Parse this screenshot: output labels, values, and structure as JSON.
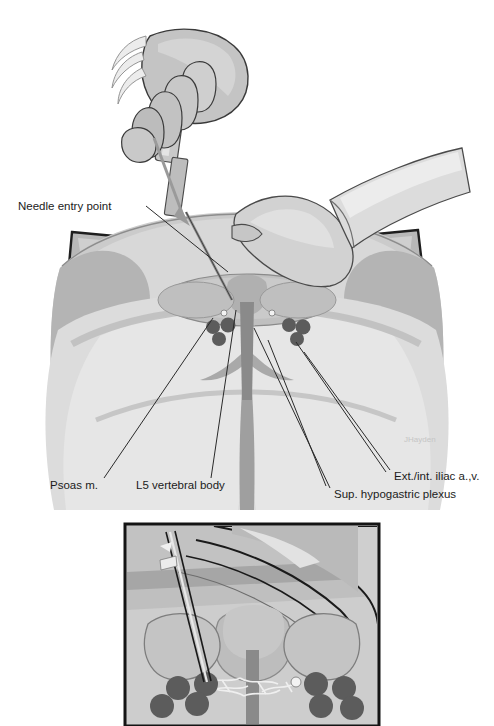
{
  "figure": {
    "type": "medical-illustration",
    "style": "grayscale-anatomical-drawing",
    "background": "#ffffff"
  },
  "labels": [
    {
      "id": "needle-entry-point",
      "text": "Needle entry point",
      "x": 18,
      "y": 210,
      "anchor": "start"
    },
    {
      "id": "psoas-muscle",
      "text": "Psoas m.",
      "x": 50,
      "y": 489,
      "anchor": "start"
    },
    {
      "id": "l5-vertebral-body",
      "text": "L5 vertebral body",
      "x": 136,
      "y": 489,
      "anchor": "start"
    },
    {
      "id": "ext-int-iliac",
      "text": "Ext./int. iliac a.,v.",
      "x": 394,
      "y": 480,
      "anchor": "start"
    },
    {
      "id": "sup-hypogastric",
      "text": "Sup. hypogastric plexus",
      "x": 334,
      "y": 498,
      "anchor": "start"
    }
  ],
  "leader_lines": [
    {
      "id": "leader-needle-entry",
      "from": [
        146,
        206
      ],
      "to": [
        228,
        272
      ]
    },
    {
      "id": "leader-psoas",
      "from": [
        104,
        478
      ],
      "to": [
        213,
        318
      ]
    },
    {
      "id": "leader-l5",
      "from": [
        211,
        478
      ],
      "to": [
        236,
        312
      ]
    },
    {
      "id": "leader-iliac-upper",
      "from": [
        390,
        472
      ],
      "to": [
        302,
        352
      ]
    },
    {
      "id": "leader-iliac-lower",
      "from": [
        388,
        474
      ],
      "to": [
        296,
        344
      ]
    },
    {
      "id": "leader-hypogastric",
      "from": [
        330,
        490
      ],
      "to": [
        254,
        330
      ]
    },
    {
      "id": "leader-hypogastric-2",
      "from": [
        326,
        488
      ],
      "to": [
        266,
        340
      ]
    }
  ],
  "colors": {
    "ink": "#2a2a2a",
    "skin_light": "#d9d9d9",
    "skin_mid": "#c2c2c2",
    "skin_shadow": "#a8a8a8",
    "drape_light": "#e3e3e3",
    "drape_dark": "#8f8f8f",
    "drape_edge": "#1e1e1e",
    "bone": "#cfcfcf",
    "bone_shadow": "#b3b3b3",
    "vessel_dark": "#5a5a5a",
    "muscle_mid": "#bdbdbd",
    "spine_dark": "#7a7a7a",
    "inset_bg": "#c8c8c8",
    "inset_frame": "#141414",
    "plexus": "#e8e8e8",
    "needle_metal": "#9a9a9a",
    "syringe_body": "#cccccc"
  },
  "main_scene": {
    "name": "posterior-view-patient",
    "description": "Prone patient lower back and buttocks with surgical drape, clinician hands holding syringe, needle inserted toward L5",
    "elements": [
      "surgical-drape",
      "patient-back",
      "buttocks",
      "gluteal-cleft",
      "clinician-hand-upper",
      "clinician-hand-lower",
      "syringe",
      "needle",
      "l5-vertebral-body",
      "psoas-muscles",
      "iliac-vessels-left",
      "iliac-vessels-right",
      "sacrum"
    ]
  },
  "vessel_clusters": {
    "left": [
      {
        "cx": 213,
        "cy": 327,
        "r": 7
      },
      {
        "cx": 228,
        "cy": 325,
        "r": 7.5
      },
      {
        "cx": 219,
        "cy": 338,
        "r": 7
      }
    ],
    "right": [
      {
        "cx": 289,
        "cy": 325,
        "r": 7
      },
      {
        "cx": 303,
        "cy": 327,
        "r": 7.5
      },
      {
        "cx": 297,
        "cy": 338,
        "r": 7
      }
    ]
  },
  "inset": {
    "name": "cross-section-detail",
    "description": "Sagittal/oblique cross-section showing needle trajectory past L5 to superior hypogastric plexus anterior to vertebral body",
    "frame": {
      "x": 125,
      "y": 524,
      "width": 254,
      "height": 202
    },
    "elements": [
      "needle-trajectory",
      "tissue-layers",
      "vertebral-body",
      "psoas-left",
      "psoas-right",
      "hypogastric-plexus-network",
      "spine-column",
      "iliac-vessels"
    ],
    "inset_vessels": {
      "left": [
        {
          "cx": 178,
          "cy": 688,
          "r": 12
        },
        {
          "cx": 204,
          "cy": 684,
          "r": 12
        },
        {
          "cx": 163,
          "cy": 705,
          "r": 12
        },
        {
          "cx": 196,
          "cy": 703,
          "r": 12
        }
      ],
      "right": [
        {
          "cx": 315,
          "cy": 684,
          "r": 12
        },
        {
          "cx": 342,
          "cy": 688,
          "r": 12
        },
        {
          "cx": 320,
          "cy": 706,
          "r": 12
        },
        {
          "cx": 350,
          "cy": 708,
          "r": 12
        }
      ]
    }
  },
  "artifact": {
    "name": "top-edge-scan-artifact",
    "x": 44,
    "y": 0,
    "width": 14,
    "height": 18
  }
}
